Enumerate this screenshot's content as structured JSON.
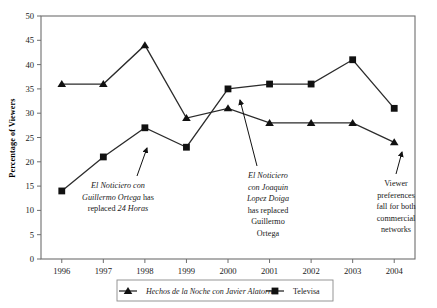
{
  "chart_data": {
    "type": "line",
    "title": "",
    "xlabel": "",
    "ylabel": "Percentage of Viewers",
    "categories": [
      "1996",
      "1997",
      "1998",
      "1999",
      "2000",
      "2001",
      "2002",
      "2003",
      "2004"
    ],
    "ylim": [
      0,
      50
    ],
    "ytick_step": 5,
    "yticks": [
      "0",
      "5",
      "10",
      "15",
      "20",
      "25",
      "30",
      "35",
      "40",
      "45",
      "50"
    ],
    "grid": false,
    "legend_position": "bottom",
    "series": [
      {
        "name": "Hechos de la Noche con Javier Alatorre",
        "marker": "triangle",
        "style": "italic",
        "values": [
          36,
          36,
          44,
          29,
          31,
          28,
          28,
          28,
          24
        ]
      },
      {
        "name": "Televisa",
        "marker": "square",
        "style": "roman",
        "values": [
          14,
          21,
          27,
          23,
          35,
          36,
          36,
          41,
          31
        ]
      }
    ],
    "annotations": [
      {
        "id": "annotation-ortega",
        "lines": [
          [
            {
              "t": "El Noticiero con",
              "i": true
            }
          ],
          [
            {
              "t": "Guillermo Ortega",
              "i": true
            },
            {
              "t": " has",
              "i": false
            }
          ],
          [
            {
              "t": "replaced ",
              "i": false
            },
            {
              "t": "24 Horas",
              "i": true
            }
          ]
        ],
        "points_to": {
          "category": "1998",
          "value": 27
        }
      },
      {
        "id": "annotation-lopez-doiga",
        "lines": [
          [
            {
              "t": "El Noticiero",
              "i": true
            }
          ],
          [
            {
              "t": "con Joaquin",
              "i": true
            }
          ],
          [
            {
              "t": "Lopez Doiga",
              "i": true
            }
          ],
          [
            {
              "t": "has replaced",
              "i": false
            }
          ],
          [
            {
              "t": "Guillermo",
              "i": false
            }
          ],
          [
            {
              "t": "Ortega",
              "i": false
            }
          ]
        ],
        "points_to": {
          "category": "2000",
          "value": 35
        }
      },
      {
        "id": "annotation-viewer-preferences",
        "lines": [
          [
            {
              "t": "Viewer",
              "i": false
            }
          ],
          [
            {
              "t": "preferences",
              "i": false
            }
          ],
          [
            {
              "t": "fall for both",
              "i": false
            }
          ],
          [
            {
              "t": "commercial",
              "i": false
            }
          ],
          [
            {
              "t": "networks",
              "i": false
            }
          ]
        ],
        "points_to": {
          "category": "2004",
          "value": 24
        }
      }
    ],
    "colors": {
      "series_line": "#2b2b2b",
      "marker": "#111111",
      "axis": "#6e6e6e",
      "text": "#1a1a1a",
      "background": "#ffffff"
    }
  }
}
